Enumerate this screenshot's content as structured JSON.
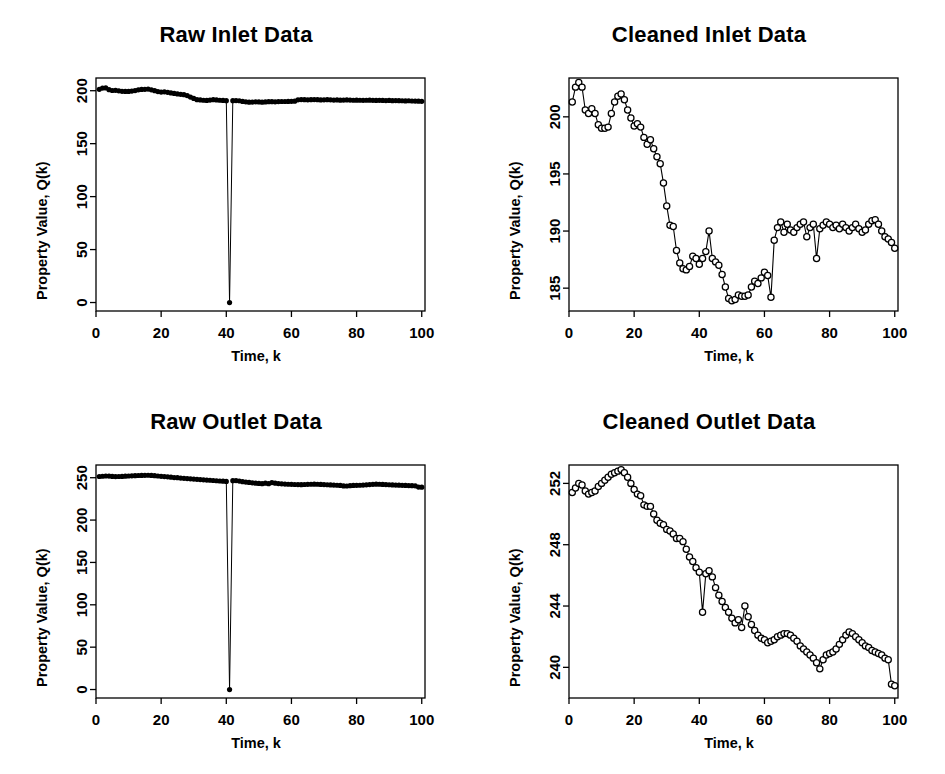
{
  "figure": {
    "layout": "2x2-grid",
    "background": "#ffffff",
    "ink_color": "#000000"
  },
  "panels": [
    {
      "id": "raw-inlet",
      "title": "Raw Inlet Data",
      "xlabel": "Time, k",
      "ylabel": "Property Value, Q(k)",
      "xticks": [
        "0",
        "20",
        "40",
        "60",
        "80",
        "100"
      ],
      "yticks": [
        "0",
        "50",
        "100",
        "150",
        "200"
      ]
    },
    {
      "id": "cleaned-inlet",
      "title": "Cleaned Inlet Data",
      "xlabel": "Time, k",
      "ylabel": "Property Value, Q(k)",
      "xticks": [
        "0",
        "20",
        "40",
        "60",
        "80",
        "100"
      ],
      "yticks": [
        "185",
        "190",
        "195",
        "200"
      ]
    },
    {
      "id": "raw-outlet",
      "title": "Raw Outlet Data",
      "xlabel": "Time, k",
      "ylabel": "Property Value, Q(k)",
      "xticks": [
        "0",
        "20",
        "40",
        "60",
        "80",
        "100"
      ],
      "yticks": [
        "0",
        "50",
        "100",
        "150",
        "200",
        "250"
      ]
    },
    {
      "id": "cleaned-outlet",
      "title": "Cleaned Outlet Data",
      "xlabel": "Time, k",
      "ylabel": "Property Value, Q(k)",
      "xticks": [
        "0",
        "20",
        "40",
        "60",
        "80",
        "100"
      ],
      "yticks": [
        "240",
        "244",
        "248",
        "252"
      ]
    }
  ],
  "chart_data": [
    {
      "type": "line",
      "id": "raw-inlet",
      "title": "Raw Inlet Data",
      "xlabel": "Time, k",
      "ylabel": "Property Value, Q(k)",
      "xlim": [
        0,
        101
      ],
      "ylim": [
        -8,
        212
      ],
      "xticks": [
        0,
        20,
        40,
        60,
        80,
        100
      ],
      "yticks": [
        0,
        50,
        100,
        150,
        200
      ],
      "grid": false,
      "legend": "none",
      "marker": "filled-circle",
      "annotation": "Single outlier spike down to 0 at k = 41",
      "x": [
        1,
        2,
        3,
        4,
        5,
        6,
        7,
        8,
        9,
        10,
        11,
        12,
        13,
        14,
        15,
        16,
        17,
        18,
        19,
        20,
        21,
        22,
        23,
        24,
        25,
        26,
        27,
        28,
        29,
        30,
        31,
        32,
        33,
        34,
        35,
        36,
        37,
        38,
        39,
        40,
        41,
        42,
        43,
        44,
        45,
        46,
        47,
        48,
        49,
        50,
        51,
        52,
        53,
        54,
        55,
        56,
        57,
        58,
        59,
        60,
        61,
        62,
        63,
        64,
        65,
        66,
        67,
        68,
        69,
        70,
        71,
        72,
        73,
        74,
        75,
        76,
        77,
        78,
        79,
        80,
        81,
        82,
        83,
        84,
        85,
        86,
        87,
        88,
        89,
        90,
        91,
        92,
        93,
        94,
        95,
        96,
        97,
        98,
        99,
        100
      ],
      "values": [
        201.3,
        202.5,
        202.6,
        201.0,
        200.2,
        200.4,
        199.9,
        199.4,
        199.3,
        199.3,
        199.7,
        200.1,
        200.8,
        201.2,
        201.3,
        201.5,
        200.8,
        200.0,
        199.2,
        198.7,
        198.9,
        198.5,
        197.9,
        197.4,
        197.0,
        196.6,
        196.3,
        195.4,
        194.0,
        192.7,
        191.5,
        191.3,
        191.0,
        190.8,
        191.2,
        191.5,
        191.3,
        191.0,
        190.8,
        190.6,
        0.0,
        190.6,
        190.7,
        190.5,
        189.9,
        189.5,
        189.2,
        189.3,
        189.5,
        189.4,
        189.2,
        189.4,
        189.6,
        189.6,
        189.5,
        189.7,
        189.8,
        189.8,
        189.9,
        190.0,
        190.1,
        191.4,
        191.6,
        191.5,
        191.4,
        191.5,
        191.6,
        191.5,
        191.3,
        191.4,
        191.5,
        191.4,
        191.2,
        191.3,
        191.1,
        191.2,
        191.3,
        191.2,
        191.0,
        191.1,
        191.0,
        190.9,
        191.0,
        191.1,
        190.9,
        190.8,
        190.9,
        190.8,
        190.7,
        190.8,
        190.6,
        190.7,
        190.6,
        190.5,
        190.4,
        190.5,
        190.3,
        190.2,
        190.1,
        190.0
      ]
    },
    {
      "type": "line",
      "id": "cleaned-inlet",
      "title": "Cleaned Inlet Data",
      "xlabel": "Time, k",
      "ylabel": "Property Value, Q(k)",
      "xlim": [
        0,
        101
      ],
      "ylim": [
        183.0,
        203.4
      ],
      "xticks": [
        0,
        20,
        40,
        60,
        80,
        100
      ],
      "yticks": [
        185,
        190,
        195,
        200
      ],
      "grid": false,
      "legend": "none",
      "marker": "open-circle",
      "annotation": "Outlier removed; step decline near k=30 and recovery near k=62",
      "x": [
        1,
        2,
        3,
        4,
        5,
        6,
        7,
        8,
        9,
        10,
        11,
        12,
        13,
        14,
        15,
        16,
        17,
        18,
        19,
        20,
        21,
        22,
        23,
        24,
        25,
        26,
        27,
        28,
        29,
        30,
        31,
        32,
        33,
        34,
        35,
        36,
        37,
        38,
        39,
        40,
        41,
        42,
        43,
        44,
        45,
        46,
        47,
        48,
        49,
        50,
        51,
        52,
        53,
        54,
        55,
        56,
        57,
        58,
        59,
        60,
        61,
        62,
        63,
        64,
        65,
        66,
        67,
        68,
        69,
        70,
        71,
        72,
        73,
        74,
        75,
        76,
        77,
        78,
        79,
        80,
        81,
        82,
        83,
        84,
        85,
        86,
        87,
        88,
        89,
        90,
        91,
        92,
        93,
        94,
        95,
        96,
        97,
        98,
        99,
        100
      ],
      "values": [
        201.3,
        202.6,
        203.0,
        202.6,
        200.6,
        200.3,
        200.7,
        200.3,
        199.3,
        199.0,
        199.0,
        199.1,
        200.3,
        201.3,
        201.8,
        202.0,
        201.5,
        200.6,
        199.9,
        199.2,
        199.4,
        199.1,
        198.2,
        197.6,
        198.0,
        197.2,
        196.5,
        195.9,
        194.2,
        192.2,
        190.5,
        190.4,
        188.3,
        187.2,
        186.7,
        186.6,
        186.9,
        187.8,
        187.6,
        187.1,
        187.6,
        188.2,
        190.0,
        187.6,
        187.3,
        187.0,
        186.2,
        185.1,
        184.1,
        183.9,
        184.0,
        184.4,
        184.3,
        184.3,
        184.4,
        185.1,
        185.6,
        185.4,
        185.9,
        186.4,
        186.1,
        184.2,
        189.2,
        190.3,
        190.8,
        189.9,
        190.6,
        190.1,
        189.9,
        190.3,
        190.6,
        190.8,
        189.5,
        190.3,
        190.6,
        187.6,
        190.2,
        190.5,
        190.8,
        190.6,
        190.3,
        190.5,
        190.2,
        190.6,
        190.3,
        190.0,
        190.3,
        190.6,
        190.2,
        189.9,
        190.1,
        190.6,
        190.9,
        191.0,
        190.6,
        190.0,
        189.5,
        189.3,
        189.0,
        188.5
      ]
    },
    {
      "type": "line",
      "id": "raw-outlet",
      "title": "Raw Outlet Data",
      "xlabel": "Time, k",
      "ylabel": "Property Value, Q(k)",
      "xlim": [
        0,
        101
      ],
      "ylim": [
        -10,
        265
      ],
      "xticks": [
        0,
        20,
        40,
        60,
        80,
        100
      ],
      "yticks": [
        0,
        50,
        100,
        150,
        200,
        250
      ],
      "grid": false,
      "legend": "none",
      "marker": "filled-circle",
      "annotation": "Single outlier spike down to 0 at k = 41",
      "x": [
        1,
        2,
        3,
        4,
        5,
        6,
        7,
        8,
        9,
        10,
        11,
        12,
        13,
        14,
        15,
        16,
        17,
        18,
        19,
        20,
        21,
        22,
        23,
        24,
        25,
        26,
        27,
        28,
        29,
        30,
        31,
        32,
        33,
        34,
        35,
        36,
        37,
        38,
        39,
        40,
        41,
        42,
        43,
        44,
        45,
        46,
        47,
        48,
        49,
        50,
        51,
        52,
        53,
        54,
        55,
        56,
        57,
        58,
        59,
        60,
        61,
        62,
        63,
        64,
        65,
        66,
        67,
        68,
        69,
        70,
        71,
        72,
        73,
        74,
        75,
        76,
        77,
        78,
        79,
        80,
        81,
        82,
        83,
        84,
        85,
        86,
        87,
        88,
        89,
        90,
        91,
        92,
        93,
        94,
        95,
        96,
        97,
        98,
        99,
        100
      ],
      "values": [
        251.4,
        251.7,
        252.0,
        251.9,
        251.5,
        251.3,
        251.4,
        251.5,
        251.8,
        252.0,
        252.2,
        252.4,
        252.6,
        252.7,
        252.8,
        252.9,
        252.7,
        252.4,
        252.0,
        251.6,
        251.3,
        251.0,
        250.6,
        250.2,
        250.0,
        249.6,
        249.3,
        249.0,
        248.7,
        248.4,
        248.1,
        247.8,
        247.5,
        247.2,
        247.0,
        246.7,
        246.4,
        246.1,
        245.9,
        245.6,
        0.0,
        246.5,
        246.6,
        246.0,
        245.3,
        244.8,
        244.4,
        244.0,
        243.6,
        243.2,
        242.9,
        243.5,
        243.0,
        244.2,
        243.6,
        243.1,
        242.8,
        242.5,
        242.3,
        242.2,
        242.0,
        241.9,
        241.8,
        242.0,
        242.2,
        242.3,
        242.4,
        242.3,
        242.1,
        241.9,
        241.7,
        241.5,
        241.3,
        241.1,
        240.9,
        240.3,
        240.2,
        240.6,
        240.9,
        241.0,
        241.1,
        241.3,
        241.6,
        241.9,
        242.2,
        242.4,
        242.3,
        242.1,
        241.9,
        241.7,
        241.5,
        241.3,
        241.2,
        241.0,
        240.9,
        240.7,
        240.6,
        240.4,
        238.9,
        238.8
      ]
    },
    {
      "type": "line",
      "id": "cleaned-outlet",
      "title": "Cleaned Outlet Data",
      "xlabel": "Time, k",
      "ylabel": "Property Value, Q(k)",
      "xlim": [
        0,
        101
      ],
      "ylim": [
        238.0,
        253.2
      ],
      "xticks": [
        0,
        20,
        40,
        60,
        80,
        100
      ],
      "yticks": [
        240,
        244,
        248,
        252
      ],
      "grid": false,
      "legend": "none",
      "marker": "open-circle",
      "annotation": "Outlier removed; steady decline with dip near k=41 and k=77",
      "x": [
        1,
        2,
        3,
        4,
        5,
        6,
        7,
        8,
        9,
        10,
        11,
        12,
        13,
        14,
        15,
        16,
        17,
        18,
        19,
        20,
        21,
        22,
        23,
        24,
        25,
        26,
        27,
        28,
        29,
        30,
        31,
        32,
        33,
        34,
        35,
        36,
        37,
        38,
        39,
        40,
        41,
        42,
        43,
        44,
        45,
        46,
        47,
        48,
        49,
        50,
        51,
        52,
        53,
        54,
        55,
        56,
        57,
        58,
        59,
        60,
        61,
        62,
        63,
        64,
        65,
        66,
        67,
        68,
        69,
        70,
        71,
        72,
        73,
        74,
        75,
        76,
        77,
        78,
        79,
        80,
        81,
        82,
        83,
        84,
        85,
        86,
        87,
        88,
        89,
        90,
        91,
        92,
        93,
        94,
        95,
        96,
        97,
        98,
        99,
        100
      ],
      "values": [
        251.4,
        251.7,
        252.0,
        251.9,
        251.5,
        251.3,
        251.4,
        251.5,
        251.8,
        252.0,
        252.2,
        252.4,
        252.6,
        252.7,
        252.8,
        252.9,
        252.7,
        252.4,
        252.0,
        251.6,
        251.3,
        251.2,
        250.6,
        250.5,
        250.5,
        250.0,
        249.6,
        249.4,
        249.3,
        249.0,
        248.9,
        248.7,
        248.4,
        248.4,
        248.2,
        247.7,
        247.2,
        246.9,
        246.5,
        246.2,
        243.6,
        246.1,
        246.3,
        245.9,
        245.2,
        244.7,
        244.3,
        243.9,
        243.6,
        243.2,
        242.9,
        243.1,
        242.6,
        244.0,
        243.3,
        242.8,
        242.4,
        242.1,
        241.9,
        241.8,
        241.6,
        241.7,
        241.8,
        242.0,
        242.1,
        242.2,
        242.2,
        242.1,
        241.9,
        241.7,
        241.4,
        241.2,
        241.0,
        240.8,
        240.6,
        240.3,
        239.9,
        240.5,
        240.8,
        240.9,
        241.0,
        241.2,
        241.5,
        241.8,
        242.1,
        242.3,
        242.2,
        242.0,
        241.8,
        241.6,
        241.4,
        241.3,
        241.1,
        241.0,
        240.9,
        240.8,
        240.6,
        240.5,
        238.9,
        238.8
      ]
    }
  ]
}
